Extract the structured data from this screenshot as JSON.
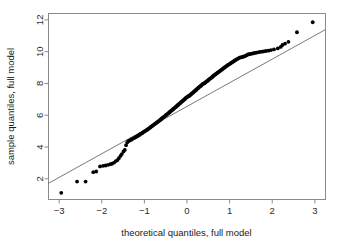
{
  "chart_data": {
    "type": "scatter",
    "title": "",
    "subtitle": "",
    "xlabel": "theoretical quantiles, full model",
    "ylabel": "sample quantiles, full model",
    "xlim": [
      -3.25,
      3.25
    ],
    "ylim": [
      0.7,
      12.4
    ],
    "xticks": [
      -3,
      -2,
      -1,
      0,
      1,
      2,
      3
    ],
    "xtick_labels": [
      "-3",
      "-2",
      "-1",
      "0",
      "1",
      "2",
      "3"
    ],
    "yticks": [
      2,
      4,
      6,
      8,
      10,
      12
    ],
    "ytick_labels": [
      "2",
      "4",
      "6",
      "8",
      "10",
      "12"
    ],
    "grid": false,
    "legend": null,
    "legend_position": "none",
    "annotations": [],
    "reference_line": {
      "name": "qqline",
      "x": [
        -3.25,
        3.25
      ],
      "y": [
        1.72,
        11.39
      ],
      "slope": 1.487,
      "intercept": 6.555,
      "color": "#555555"
    },
    "series": [
      {
        "name": "sample quantiles, full model",
        "marker": "filled-circle",
        "color": "#000000",
        "x": [
          -2.95,
          -2.58,
          -2.38,
          -2.2,
          -2.13,
          -2.04,
          -1.97,
          -1.91,
          -1.85,
          -1.8,
          -1.76,
          -1.71,
          -1.67,
          -1.63,
          -1.6,
          -1.56,
          -1.53,
          -1.49,
          -1.46,
          -1.43,
          -1.4,
          -1.37,
          -1.34,
          -1.31,
          -1.29,
          -1.26,
          -1.23,
          -1.21,
          -1.18,
          -1.16,
          -1.13,
          -1.11,
          -1.09,
          -1.06,
          -1.04,
          -1.02,
          -1.0,
          -0.97,
          -0.95,
          -0.93,
          -0.91,
          -0.89,
          -0.87,
          -0.85,
          -0.83,
          -0.81,
          -0.79,
          -0.77,
          -0.75,
          -0.73,
          -0.71,
          -0.69,
          -0.67,
          -0.65,
          -0.63,
          -0.61,
          -0.6,
          -0.58,
          -0.56,
          -0.54,
          -0.52,
          -0.5,
          -0.49,
          -0.47,
          -0.45,
          -0.43,
          -0.41,
          -0.4,
          -0.38,
          -0.36,
          -0.34,
          -0.33,
          -0.31,
          -0.29,
          -0.27,
          -0.26,
          -0.24,
          -0.22,
          -0.21,
          -0.19,
          -0.17,
          -0.15,
          -0.14,
          -0.12,
          -0.1,
          -0.09,
          -0.07,
          -0.05,
          -0.04,
          -0.02,
          0.0,
          0.02,
          0.04,
          0.05,
          0.07,
          0.09,
          0.1,
          0.12,
          0.14,
          0.15,
          0.17,
          0.19,
          0.21,
          0.22,
          0.24,
          0.26,
          0.27,
          0.29,
          0.31,
          0.33,
          0.34,
          0.36,
          0.38,
          0.4,
          0.41,
          0.43,
          0.45,
          0.47,
          0.49,
          0.5,
          0.52,
          0.54,
          0.56,
          0.58,
          0.6,
          0.61,
          0.63,
          0.65,
          0.67,
          0.69,
          0.71,
          0.73,
          0.75,
          0.77,
          0.79,
          0.81,
          0.83,
          0.85,
          0.87,
          0.89,
          0.91,
          0.93,
          0.95,
          0.97,
          1.0,
          1.02,
          1.04,
          1.06,
          1.09,
          1.11,
          1.13,
          1.16,
          1.18,
          1.21,
          1.23,
          1.26,
          1.29,
          1.31,
          1.34,
          1.37,
          1.4,
          1.43,
          1.46,
          1.49,
          1.53,
          1.56,
          1.6,
          1.63,
          1.67,
          1.71,
          1.76,
          1.8,
          1.85,
          1.91,
          1.97,
          2.04,
          2.13,
          2.2,
          2.24,
          2.3,
          2.38,
          2.58,
          2.95
        ],
        "y": [
          1.12,
          1.83,
          1.83,
          2.42,
          2.46,
          2.78,
          2.82,
          2.84,
          2.88,
          2.92,
          2.95,
          3.02,
          3.12,
          3.18,
          3.3,
          3.44,
          3.56,
          3.72,
          3.82,
          4.12,
          4.3,
          4.38,
          4.42,
          4.46,
          4.5,
          4.55,
          4.58,
          4.62,
          4.66,
          4.7,
          4.74,
          4.78,
          4.82,
          4.86,
          4.9,
          4.94,
          4.98,
          5.02,
          5.06,
          5.1,
          5.14,
          5.18,
          5.22,
          5.26,
          5.3,
          5.34,
          5.38,
          5.42,
          5.46,
          5.5,
          5.54,
          5.58,
          5.62,
          5.66,
          5.7,
          5.74,
          5.78,
          5.82,
          5.86,
          5.9,
          5.94,
          5.98,
          6.02,
          6.06,
          6.1,
          6.14,
          6.18,
          6.22,
          6.26,
          6.3,
          6.34,
          6.38,
          6.42,
          6.46,
          6.5,
          6.54,
          6.58,
          6.62,
          6.66,
          6.7,
          6.74,
          6.78,
          6.82,
          6.86,
          6.9,
          6.94,
          6.98,
          7.02,
          7.06,
          7.1,
          7.14,
          7.18,
          7.2,
          7.22,
          7.26,
          7.3,
          7.34,
          7.38,
          7.42,
          7.46,
          7.5,
          7.54,
          7.58,
          7.62,
          7.66,
          7.7,
          7.74,
          7.78,
          7.82,
          7.86,
          7.9,
          7.94,
          7.98,
          8.0,
          8.02,
          8.06,
          8.1,
          8.14,
          8.18,
          8.22,
          8.26,
          8.3,
          8.34,
          8.38,
          8.42,
          8.46,
          8.5,
          8.54,
          8.58,
          8.62,
          8.66,
          8.7,
          8.74,
          8.78,
          8.82,
          8.86,
          8.9,
          8.94,
          8.98,
          9.02,
          9.06,
          9.1,
          9.14,
          9.18,
          9.22,
          9.26,
          9.3,
          9.34,
          9.38,
          9.42,
          9.46,
          9.5,
          9.54,
          9.58,
          9.62,
          9.64,
          9.66,
          9.68,
          9.7,
          9.73,
          9.78,
          9.82,
          9.84,
          9.86,
          9.88,
          9.9,
          9.92,
          9.94,
          9.96,
          9.98,
          10.0,
          10.02,
          10.04,
          10.06,
          10.1,
          10.14,
          10.2,
          10.3,
          10.42,
          10.5,
          10.62,
          11.22,
          11.85
        ]
      }
    ]
  },
  "axes": {
    "x_title": "theoretical quantiles, full model",
    "y_title": "sample quantiles, full model"
  }
}
